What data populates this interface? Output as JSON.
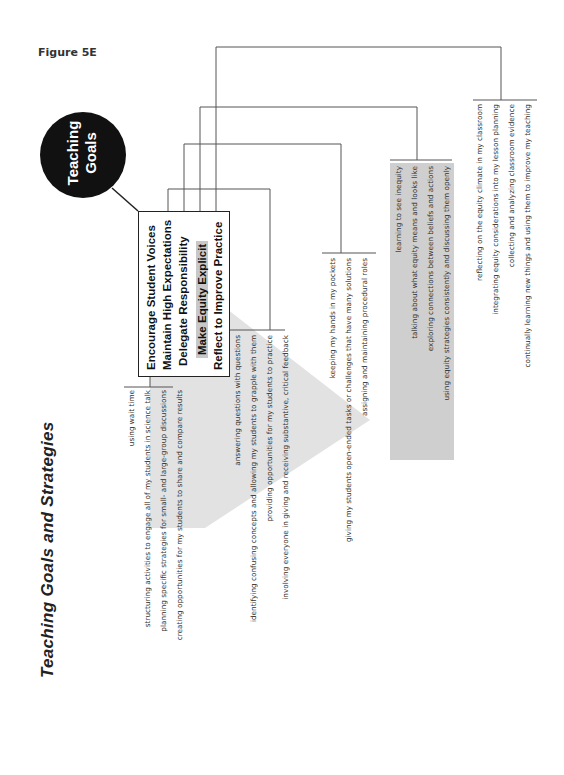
{
  "figure_label": "Figure 5E",
  "title": "Teaching Goals and Strategies",
  "hub": {
    "line1": "Teaching",
    "line2": "Goals"
  },
  "goals": [
    {
      "label": "Encourage Student Voices",
      "highlighted": false
    },
    {
      "label": "Maintain High Expectations",
      "highlighted": false
    },
    {
      "label": "Delegate Responsibility",
      "highlighted": false
    },
    {
      "label": "Make Equity Explicit",
      "highlighted": true
    },
    {
      "label": "Reflect to Improve Practice",
      "highlighted": false
    }
  ],
  "strategy_groups": [
    {
      "goal": "Encourage Student Voices",
      "items": [
        "using wait time",
        "structuring activities to engage all of my students in science talk",
        "planning specific strategies for small- and large-group discussions",
        "creating opportunities for my students to share and compare results"
      ]
    },
    {
      "goal": "Maintain High Expectations",
      "items": [
        "answering questions with questions",
        "identifying confusing concepts and allowing my students to grapple with them",
        "providing opportunities for my students to practice",
        "involving everyone in giving and receiving substantive, critical feedback"
      ]
    },
    {
      "goal": "Delegate Responsibility",
      "items": [
        "keeping my hands in my pockets",
        "giving my students open-ended tasks or challenges that have many solutions",
        "assigning and maintaining procedural roles"
      ]
    },
    {
      "goal": "Make Equity Explicit",
      "highlighted": true,
      "items": [
        "learning to see inequity",
        "talking about what equity means and looks like",
        "exploring connections between beliefs and actions",
        "using equity strategies consistently and discussing them openly"
      ]
    },
    {
      "goal": "Reflect to Improve Practice",
      "items": [
        "reflecting on the equity climate in my classroom",
        "integrating equity considerations into my lesson planning",
        "collecting and analyzing classroom evidence",
        "continually learning new things and using them to improve my teaching"
      ]
    }
  ],
  "colors": {
    "hub_fill": "#111111",
    "highlight_gray": "#c8c8c8",
    "panel_gray": "#cfcfcf",
    "arrow_gray": "#e2e2e2",
    "line": "#555555"
  }
}
